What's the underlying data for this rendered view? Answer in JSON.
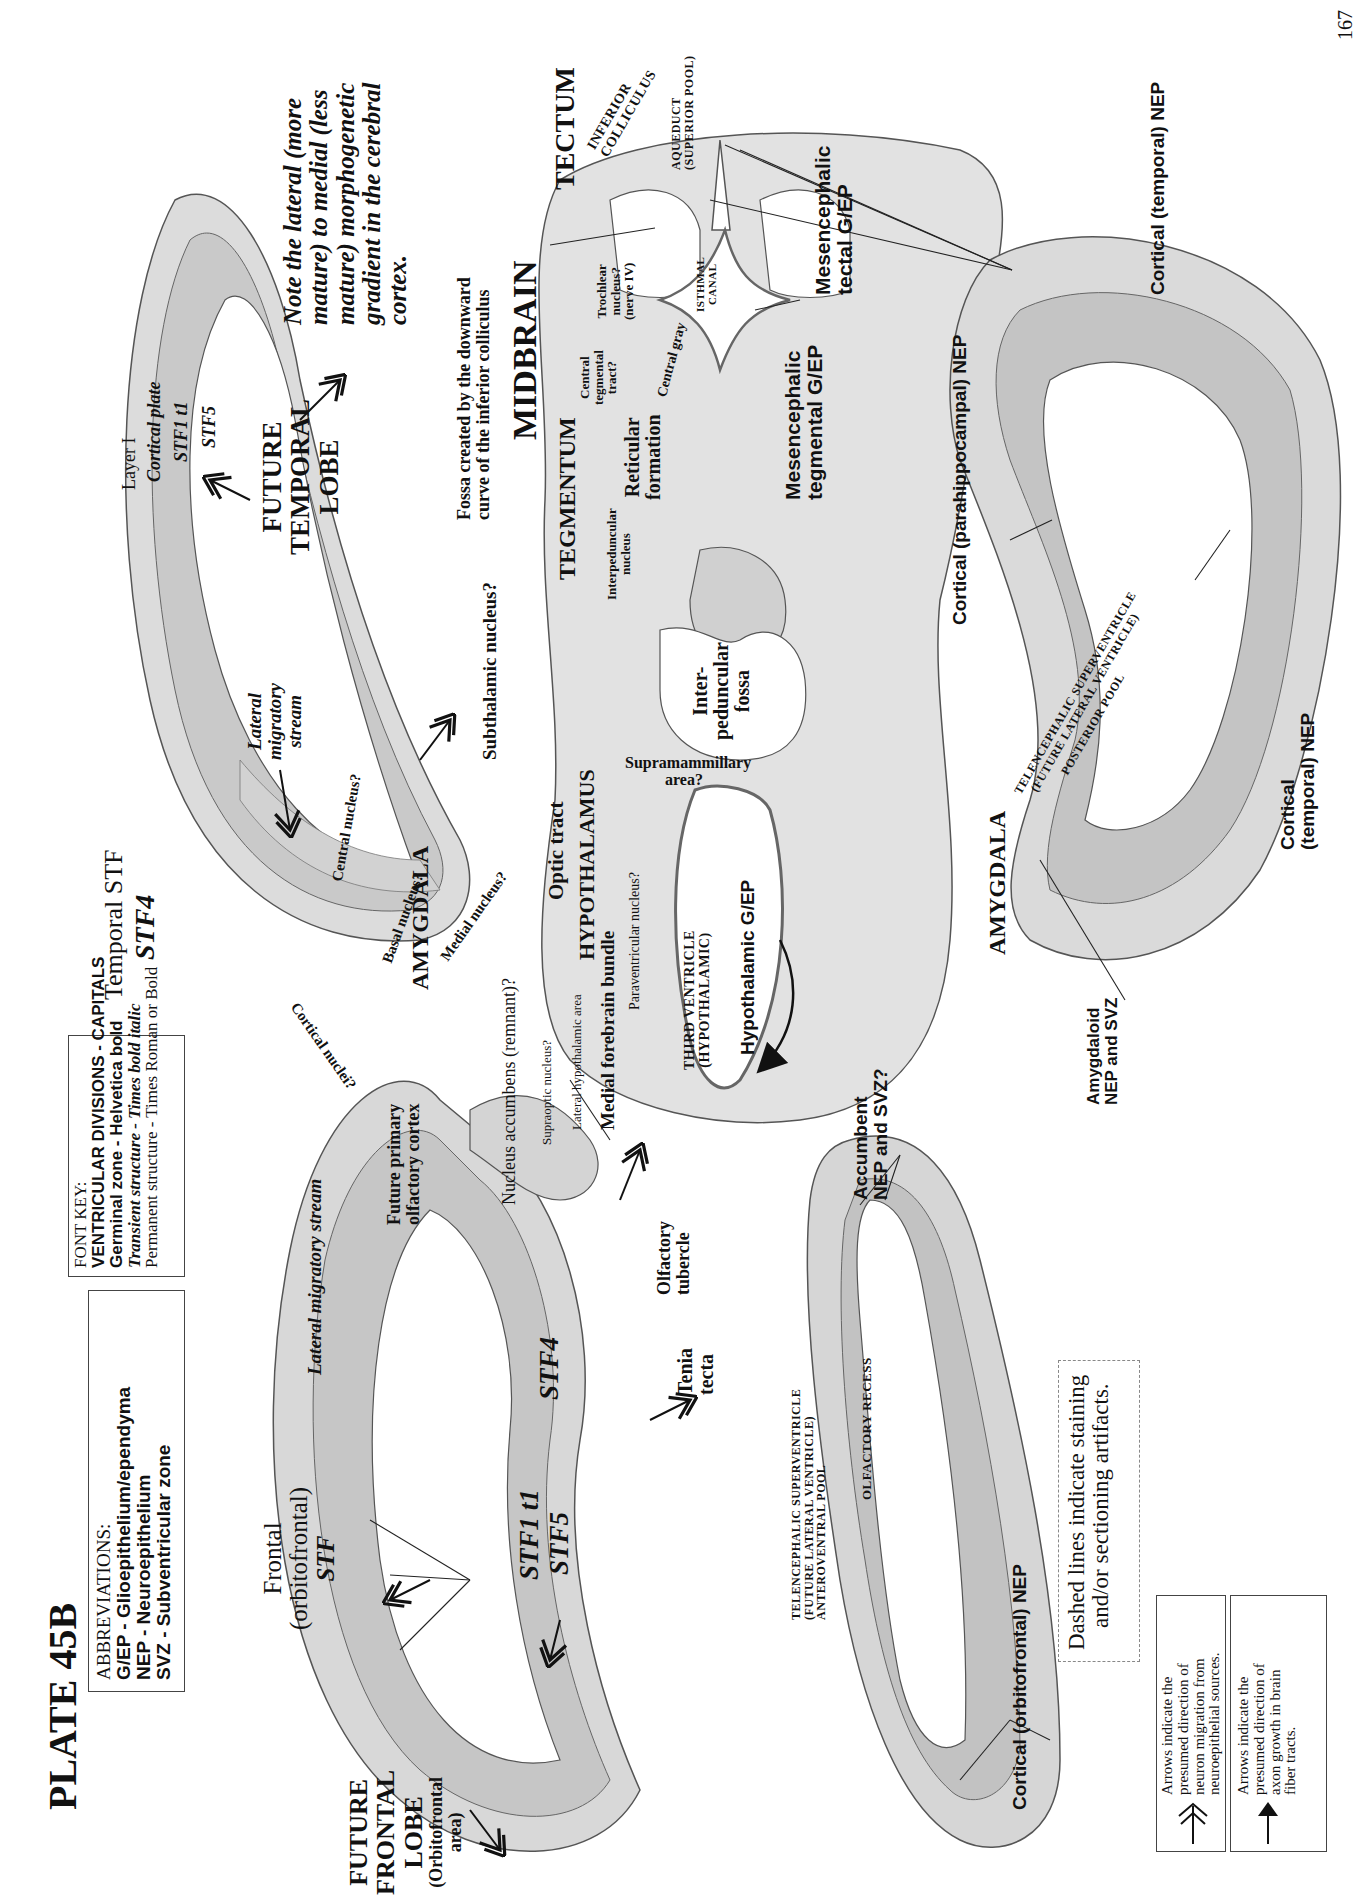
{
  "page": {
    "plate_title": "PLATE 45B",
    "page_number": "167"
  },
  "abbreviations": {
    "heading": "ABBREVIATIONS:",
    "items": [
      "G/EP - Glioepithelium/ependyma",
      "NEP - Neuroepithelium",
      "SVZ - Subventricular zone"
    ]
  },
  "font_key": {
    "heading": "FONT KEY:",
    "items": [
      "VENTRICULAR DIVISIONS - CAPITALS",
      "Germinal zone - Helvetica bold",
      "Transient structure - Times bold italic",
      "Permanent structure - Times Roman or Bold"
    ]
  },
  "note": {
    "lines": [
      "Note the lateral (more",
      "mature) to medial (less",
      "mature) morphogenetic",
      "gradient in the cerebral",
      "cortex."
    ]
  },
  "temporal_left": {
    "future_lobe": [
      "FUTURE",
      "TEMPORAL",
      "LOBE"
    ],
    "layers": [
      "Layer I",
      "Cortical plate",
      "STF1 t1",
      "STF5"
    ],
    "temporal_stf": [
      "Temporal STF",
      "STF4"
    ],
    "lateral_migratory_stream": [
      "Lateral",
      "migratory",
      "stream"
    ],
    "amygdala": "AMYGDALA",
    "nuclei": [
      "Central nucleus?",
      "Basal nucleus?",
      "Medial nucleus?",
      "Cortical nuclei?"
    ]
  },
  "frontal_left": {
    "future_lobe": [
      "FUTURE",
      "FRONTAL",
      "LOBE",
      "(Orbitofrontal",
      "area)"
    ],
    "frontal_stf": [
      "Frontal",
      "(orbitofrontal)",
      "STF"
    ],
    "layers": [
      "STF1 t1",
      "STF5",
      "STF4"
    ],
    "lateral_migratory_stream": "Lateral migratory stream",
    "future_primary_olfactory_cortex": [
      "Future primary",
      "olfactory cortex"
    ],
    "olfactory_tubercle": [
      "Olfactory",
      "tubercle"
    ],
    "tenia_tecta": [
      "Tenia",
      "tecta"
    ],
    "nucleus_accumbens": "Nucleus accumbens (remnant)?"
  },
  "midbrain": {
    "fossa_note": [
      "Fossa created by the downward",
      "curve of the inferior colliculus"
    ],
    "midbrain": "MIDBRAIN",
    "tectum": "TECTUM",
    "tegmentum": "TEGMENTUM",
    "inferior_colliculus": [
      "INFERIOR",
      "COLLICULUS"
    ],
    "aqueduct": [
      "AQUEDUCT",
      "(SUPERIOR POOL)"
    ],
    "isthmal_canal": [
      "ISTHMAL",
      "CANAL"
    ],
    "trochlear": [
      "Trochlear",
      "nucleus?",
      "(nerve IV)"
    ],
    "central_gray": "Central gray",
    "central_tegmental_tract": [
      "Central",
      "tegmental",
      "tract?"
    ],
    "reticular_formation": [
      "Reticular",
      "formation"
    ],
    "interpeduncular_nucleus": [
      "Interpeduncular",
      "nucleus"
    ],
    "interpeduncular_fossa": [
      "Inter-",
      "peduncular",
      "fossa"
    ],
    "mesencephalic_tectal": [
      "Mesencephalic",
      "tectal G/EP"
    ],
    "mesencephalic_tegmental": [
      "Mesencephalic",
      "tegmental G/EP"
    ]
  },
  "hypothalamus": {
    "subthalamic": "Subthalamic nucleus?",
    "supramammillary": [
      "Supramammillary",
      "area?"
    ],
    "hypothalamus": "HYPOTHALAMUS",
    "optic_tract": "Optic tract",
    "paraventricular": "Paraventricular nucleus?",
    "medial_forebrain_bundle": "Medial forebrain bundle",
    "lateral_hypothalamic_area": "Lateral hypothalamic area",
    "supraoptic": "Supraoptic nucleus?",
    "third_ventricle": [
      "THIRD VENTRICLE",
      "(HYPOTHALAMIC)"
    ],
    "hypothalamic_gep": "Hypothalamic G/EP"
  },
  "right_side": {
    "cortical_temporal_nep_top": "Cortical (temporal) NEP",
    "cortical_parahippocampal_nep": "Cortical (parahippocampal) NEP",
    "cortical_temporal_nep_bottom": [
      "Cortical",
      "(temporal) NEP"
    ],
    "telencephalic_superventricle_posterior": [
      "TELENCEPHALIC SUPERVENTRICLE",
      "(FUTURE LATERAL VENTRICLE)",
      "POSTERIOR POOL"
    ],
    "amygdala": "AMYGDALA",
    "amygdaloid_nep": [
      "Amygdaloid",
      "NEP and SVZ"
    ],
    "accumbent_nep": [
      "Accumbent",
      "NEP and SVZ?"
    ],
    "olfactory_recess": "OLFACTORY RECESS",
    "telencephalic_superventricle_anteroventral": [
      "TELENCEPHALIC SUPERVENTRICLE",
      "(FUTURE LATERAL VENTRICLE)",
      "ANTEROVENTRAL POOL"
    ],
    "cortical_orbitofrontal_nep": "Cortical (orbitofrontal) NEP"
  },
  "dashed_note": [
    "Dashed lines indicate staining",
    "and/or sectioning artifacts."
  ],
  "legend": {
    "migration": [
      "Arrows indicate the",
      "presumed direction of",
      "neuron migration from",
      "neuroepithelial sources."
    ],
    "axon": [
      "Arrows indicate the",
      "presumed direction of",
      "axon growth in brain",
      "fiber tracts."
    ]
  },
  "colors": {
    "tissue_light": "#e4e4e4",
    "tissue_mid": "#cfcfcf",
    "tissue_dark": "#a8a8a8",
    "outline": "#555555",
    "ink": "#111111"
  }
}
